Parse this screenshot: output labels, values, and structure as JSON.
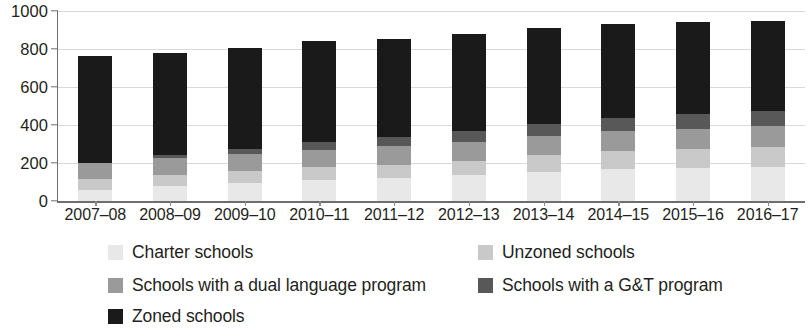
{
  "chart_data": {
    "type": "bar",
    "stacked": true,
    "title": "",
    "subtitle": "",
    "xlabel": "",
    "ylabel": "",
    "ylim": [
      0,
      1000
    ],
    "yticks": [
      0,
      200,
      400,
      600,
      800,
      1000
    ],
    "grid": true,
    "legend_position": "bottom",
    "categories": [
      "2007–08",
      "2008–09",
      "2009–10",
      "2010–11",
      "2011–12",
      "2012–13",
      "2013–14",
      "2014–15",
      "2015–16",
      "2016–17"
    ],
    "series": [
      {
        "name": "Charter schools",
        "color": "#e8e8e8",
        "values": [
          60,
          78,
          95,
          110,
          120,
          135,
          155,
          170,
          175,
          180
        ]
      },
      {
        "name": "Unzoned schools",
        "color": "#c9c9c9",
        "values": [
          55,
          58,
          62,
          68,
          72,
          78,
          85,
          92,
          98,
          105
        ]
      },
      {
        "name": "Schools with a dual language program",
        "color": "#9a9a9a",
        "values": [
          85,
          88,
          90,
          92,
          95,
          98,
          100,
          105,
          108,
          110
        ]
      },
      {
        "name": "Schools with a G&T program",
        "color": "#585858",
        "values": [
          0,
          18,
          25,
          40,
          48,
          58,
          65,
          72,
          75,
          78
        ]
      },
      {
        "name": "Zoned schools",
        "color": "#1a1a1a",
        "values": [
          565,
          538,
          533,
          530,
          520,
          511,
          505,
          491,
          484,
          477
        ]
      }
    ],
    "totals": [
      765,
      780,
      805,
      840,
      855,
      880,
      910,
      930,
      940,
      950
    ]
  },
  "legend": {
    "items": [
      {
        "label": "Charter schools",
        "swatch": "#e8e8e8"
      },
      {
        "label": "Unzoned schools",
        "swatch": "#c9c9c9"
      },
      {
        "label": "Schools with a dual language program",
        "swatch": "#9a9a9a"
      },
      {
        "label": "Schools with a G&T program",
        "swatch": "#585858"
      },
      {
        "label": "Zoned schools",
        "swatch": "#1a1a1a"
      }
    ]
  }
}
